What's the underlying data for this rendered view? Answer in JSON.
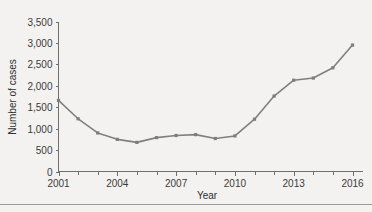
{
  "chart_data": {
    "type": "line",
    "title": "",
    "xlabel": "Year",
    "ylabel": "Number of cases",
    "x": [
      2001,
      2002,
      2003,
      2004,
      2005,
      2006,
      2007,
      2008,
      2009,
      2010,
      2011,
      2012,
      2013,
      2014,
      2015,
      2016
    ],
    "values": [
      1660,
      1230,
      900,
      750,
      680,
      790,
      840,
      860,
      770,
      830,
      1220,
      1760,
      2130,
      2180,
      2420,
      2950
    ],
    "series": [
      {
        "name": "Number of cases",
        "values": [
          1660,
          1230,
          900,
          750,
          680,
          790,
          840,
          860,
          770,
          830,
          1220,
          1760,
          2130,
          2180,
          2420,
          2950
        ]
      }
    ],
    "xlim": [
      2001,
      2016
    ],
    "ylim": [
      0,
      3500
    ],
    "xtick_values": [
      2001,
      2004,
      2007,
      2010,
      2013,
      2016
    ],
    "xtick_labels": [
      "2001",
      "2004",
      "2007",
      "2010",
      "2013",
      "2016"
    ],
    "xtick_minor_values": [
      2002,
      2003,
      2005,
      2006,
      2008,
      2009,
      2011,
      2012,
      2014,
      2015
    ],
    "ytick_values": [
      0,
      500,
      1000,
      1500,
      2000,
      2500,
      3000,
      3500
    ],
    "ytick_labels": [
      "0",
      "500",
      "1,000",
      "1,500",
      "2,000",
      "2,500",
      "3,000",
      "3,500"
    ],
    "grid": false,
    "legend": false,
    "legend_position": "none",
    "marker": "square",
    "line_color": "#808080",
    "marker_color": "#7d7d7d",
    "axis_color": "#6f6f6f",
    "background_color": "#f3f2f0",
    "text_color": "#3b3b3b"
  }
}
